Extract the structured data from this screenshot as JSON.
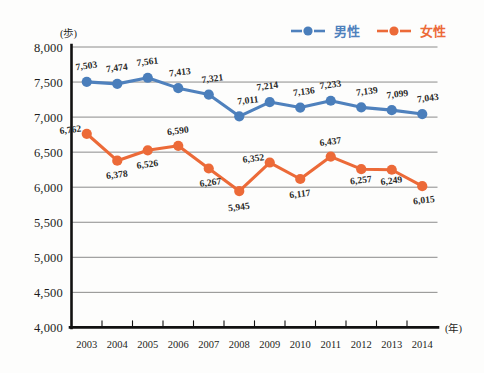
{
  "chart_data": {
    "type": "line",
    "title": "",
    "subtitle": "",
    "xlabel": "(年)",
    "ylabel": "(歩)",
    "categories": [
      "2003",
      "2004",
      "2005",
      "2006",
      "2007",
      "2008",
      "2009",
      "2010",
      "2011",
      "2012",
      "2013",
      "2014"
    ],
    "ylim": [
      4000,
      8000
    ],
    "ytick_labels": [
      "8,000",
      "7,500",
      "7,000",
      "6,500",
      "6,000",
      "5,500",
      "5,000",
      "4,500",
      "4,000"
    ],
    "ytick_values": [
      8000,
      7500,
      7000,
      6500,
      6000,
      5500,
      5000,
      4500,
      4000
    ],
    "grid": true,
    "legend_position": "top-right",
    "series": [
      {
        "name": "男性",
        "color": "#4f81bd",
        "values": [
          7503,
          7474,
          7561,
          7413,
          7321,
          7011,
          7214,
          7136,
          7233,
          7139,
          7099,
          7043
        ],
        "labels": [
          "7,503",
          "7,474",
          "7,561",
          "7,413",
          "7,321",
          "7,011",
          "7,214",
          "7,136",
          "7,233",
          "7,139",
          "7,099",
          "7,043"
        ]
      },
      {
        "name": "女性",
        "color": "#ec6a38",
        "values": [
          6762,
          6378,
          6526,
          6590,
          6267,
          5945,
          6352,
          6117,
          6437,
          6257,
          6249,
          6015
        ],
        "labels": [
          "6,762",
          "6,378",
          "6,526",
          "6,590",
          "6,267",
          "5,945",
          "6,352",
          "6,117",
          "6,437",
          "6,257",
          "6,249",
          "6,015"
        ]
      }
    ]
  },
  "legend": {
    "items": [
      {
        "label": "男性",
        "color": "#4f81bd"
      },
      {
        "label": "女性",
        "color": "#ec6a38"
      }
    ]
  },
  "axis": {
    "y_unit": "(歩)",
    "x_unit": "(年)"
  },
  "colors": {
    "male": "#4f81bd",
    "female": "#ec6a38",
    "grid": "#6f6f6e",
    "axis": "#111111",
    "background": "#fdfdfc"
  }
}
